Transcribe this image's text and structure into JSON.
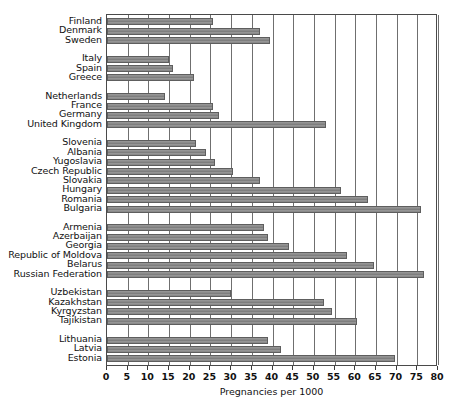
{
  "chart_data": {
    "type": "bar",
    "orientation": "horizontal",
    "title": "",
    "xlabel": "Pregnancies per 1000",
    "ylabel": "",
    "xlim": [
      0,
      80
    ],
    "xticks": [
      0,
      5,
      10,
      15,
      20,
      25,
      30,
      35,
      40,
      45,
      50,
      55,
      60,
      65,
      70,
      75,
      80
    ],
    "grid": true,
    "legend": "none",
    "bar_color": "#8a8a8a",
    "categories": [
      "Finland",
      "Denmark",
      "Sweden",
      "Italy",
      "Spain",
      "Greece",
      "Netherlands",
      "France",
      "Germany",
      "United Kingdom",
      "Slovenia",
      "Albania",
      "Yugoslavia",
      "Czech Republic",
      "Slovakia",
      "Hungary",
      "Romania",
      "Bulgaria",
      "Armenia",
      "Azerbaijan",
      "Georgia",
      "Republic of Moldova",
      "Belarus",
      "Russian Federation",
      "Uzbekistan",
      "Kazakhstan",
      "Kyrgyzstan",
      "Tajikistan",
      "Lithuania",
      "Latvia",
      "Estonia"
    ],
    "values": [
      25.5,
      37.0,
      39.5,
      15.0,
      16.0,
      21.0,
      14.0,
      25.5,
      27.0,
      53.0,
      21.5,
      24.0,
      26.0,
      30.5,
      37.0,
      56.5,
      63.0,
      76.0,
      38.0,
      39.0,
      44.0,
      58.0,
      64.5,
      76.5,
      30.0,
      52.5,
      54.5,
      60.5,
      39.0,
      42.0,
      69.5
    ],
    "groups": [
      {
        "name": "nordic",
        "start": 0,
        "count": 3
      },
      {
        "name": "southern-europe",
        "start": 3,
        "count": 3
      },
      {
        "name": "western-europe",
        "start": 6,
        "count": 4
      },
      {
        "name": "central-eastern-europe",
        "start": 10,
        "count": 8
      },
      {
        "name": "caucasus-and-western-cis",
        "start": 18,
        "count": 6
      },
      {
        "name": "central-asia",
        "start": 24,
        "count": 4
      },
      {
        "name": "baltic",
        "start": 28,
        "count": 3
      }
    ]
  }
}
